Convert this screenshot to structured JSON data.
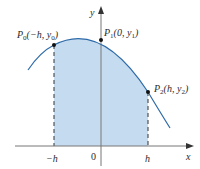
{
  "figure": {
    "colors": {
      "curve": "#2e6aa8",
      "fill": "#c5dcf0",
      "axis": "#555555",
      "dash": "#333333",
      "point": "#111111"
    },
    "axes": {
      "x_label": "x",
      "y_label": "y",
      "ticks": {
        "neg_h": "−h",
        "zero": "0",
        "h": "h"
      }
    },
    "points": [
      {
        "name": "P0",
        "label_main": "P",
        "label_sub": "0",
        "label_coords": "(−h, y",
        "label_coords_sub": "0",
        "label_close": ")"
      },
      {
        "name": "P1",
        "label_main": "P",
        "label_sub": "1",
        "label_coords": "(0, y",
        "label_coords_sub": "1",
        "label_close": ")"
      },
      {
        "name": "P2",
        "label_main": "P",
        "label_sub": "2",
        "label_coords": "(h, y",
        "label_coords_sub": "2",
        "label_close": ")"
      }
    ]
  }
}
